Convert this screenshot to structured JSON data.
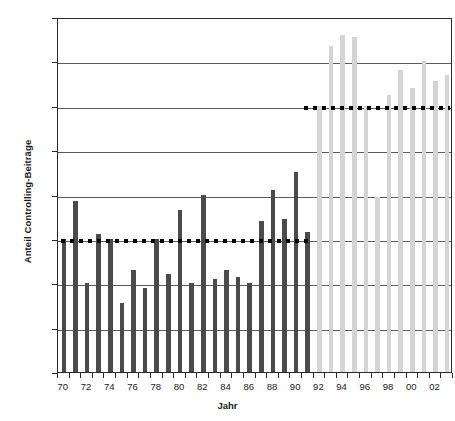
{
  "chart_data": {
    "type": "bar",
    "title": "",
    "xlabel": "Jahr",
    "ylabel": "Anteil Controlling-Beiträge",
    "ylim": [
      0,
      16
    ],
    "yunit": "%",
    "ytick_labels": [
      "0%",
      "2%",
      "4%",
      "6%",
      "8%",
      "10%",
      "12%",
      "14%",
      "16%"
    ],
    "ytick_values": [
      0,
      2,
      4,
      6,
      8,
      10,
      12,
      14,
      16
    ],
    "xtick_labels": [
      "70",
      "72",
      "74",
      "76",
      "78",
      "80",
      "82",
      "84",
      "86",
      "88",
      "90",
      "92",
      "94",
      "96",
      "98",
      "00",
      "02"
    ],
    "grid": true,
    "legend": "none",
    "categories": [
      "70",
      "71",
      "72",
      "73",
      "74",
      "75",
      "76",
      "77",
      "78",
      "79",
      "80",
      "81",
      "82",
      "83",
      "84",
      "85",
      "86",
      "87",
      "88",
      "89",
      "90",
      "91",
      "92",
      "93",
      "94",
      "95",
      "96",
      "97",
      "98",
      "99",
      "00",
      "01",
      "02",
      "03"
    ],
    "values": [
      6.0,
      7.7,
      4.0,
      6.2,
      6.0,
      3.1,
      4.6,
      3.8,
      6.0,
      4.4,
      7.3,
      4.0,
      8.0,
      4.2,
      4.6,
      4.3,
      4.0,
      6.8,
      8.2,
      6.9,
      9.0,
      6.3,
      12.0,
      14.7,
      15.2,
      15.1,
      12.0,
      7.9,
      12.5,
      13.6,
      12.8,
      14.0,
      13.1,
      13.4
    ],
    "values_tail": [
      13.5,
      13.5,
      13.0,
      11.8
    ],
    "series_colors": {
      "dark": "#4a4a4a",
      "light": "#d4d4d4"
    },
    "bar_groups": [
      {
        "name": "1970-1991",
        "color_key": "dark",
        "start_index": 0,
        "end_index": 21
      },
      {
        "name": "1992-2003",
        "color_key": "light",
        "start_index": 22,
        "end_index": 33
      }
    ],
    "reference_lines": [
      {
        "name": "mean-1970-1991",
        "value": 6.0,
        "label": "6%",
        "start_index": 0,
        "end_index": 21,
        "style": "dotted",
        "color": "#000000"
      },
      {
        "name": "mean-1992-2003",
        "value": 12.0,
        "label": "12%",
        "start_index": 21,
        "end_index": 33,
        "style": "dotted",
        "color": "#000000"
      }
    ]
  }
}
